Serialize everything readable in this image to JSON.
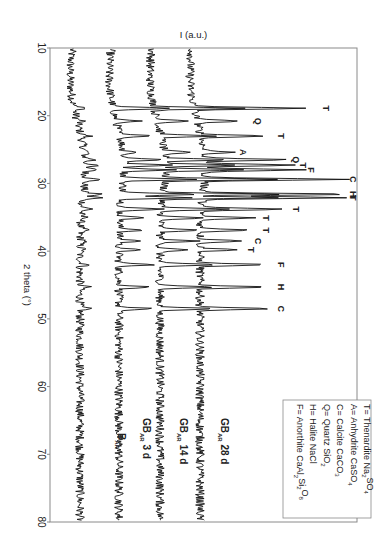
{
  "chart_data": {
    "type": "line",
    "title": "",
    "orientation": "rotated-90 (2theta axis vertical increasing downward, intensity increasing rightward)",
    "xlabel": "2 theta (°)",
    "ylabel": "I (a.u.)",
    "xlim": [
      10,
      80
    ],
    "x_ticks": [
      10,
      20,
      30,
      40,
      50,
      60,
      70,
      80
    ],
    "grid": false,
    "series": [
      {
        "name": "B_AR",
        "label_main": "B",
        "label_sub": "AR",
        "label_suffix": "",
        "offset": 0
      },
      {
        "name": "GB_AR 3 d",
        "label_main": "GB",
        "label_sub": "AR",
        "label_suffix": " 3 d",
        "offset": 1
      },
      {
        "name": "GB_AR 14 d",
        "label_main": "GB",
        "label_sub": "AR",
        "label_suffix": " 14 d",
        "offset": 2
      },
      {
        "name": "GB_AR 28 d",
        "label_main": "GB",
        "label_sub": "AR",
        "label_suffix": " 28 d",
        "offset": 3
      }
    ],
    "peaks": [
      {
        "two_theta": 18.9,
        "phase": "T",
        "strength": 0.75
      },
      {
        "two_theta": 20.8,
        "phase": "Q",
        "strength": 0.3
      },
      {
        "two_theta": 23.0,
        "phase": "T",
        "strength": 0.45
      },
      {
        "two_theta": 25.4,
        "phase": "A",
        "strength": 0.2
      },
      {
        "two_theta": 26.5,
        "phase": "Q",
        "strength": 0.55
      },
      {
        "two_theta": 27.3,
        "phase": "T",
        "strength": 0.6
      },
      {
        "two_theta": 28.0,
        "phase": "F",
        "strength": 0.65
      },
      {
        "two_theta": 29.4,
        "phase": "C",
        "strength": 0.95
      },
      {
        "two_theta": 31.6,
        "phase": "H",
        "strength": 1.0
      },
      {
        "two_theta": 32.1,
        "phase": "T",
        "strength": 0.95
      },
      {
        "two_theta": 33.8,
        "phase": "T",
        "strength": 0.55
      },
      {
        "two_theta": 35.1,
        "phase": "T",
        "strength": 0.35
      },
      {
        "two_theta": 36.9,
        "phase": "T",
        "strength": 0.35
      },
      {
        "two_theta": 38.5,
        "phase": "C",
        "strength": 0.3
      },
      {
        "two_theta": 39.8,
        "phase": "T",
        "strength": 0.25
      },
      {
        "two_theta": 42.0,
        "phase": "F",
        "strength": 0.45
      },
      {
        "two_theta": 45.3,
        "phase": "H",
        "strength": 0.45
      },
      {
        "two_theta": 48.5,
        "phase": "C",
        "strength": 0.45
      }
    ],
    "legend": {
      "position": "lower-right (rotated)",
      "entries": [
        {
          "text": "T= Thenardite Na",
          "formula_tail": [
            [
              "2",
              "sub"
            ],
            [
              "SO",
              ""
            ],
            [
              "4",
              "sub"
            ]
          ]
        },
        {
          "text": "A= Anhydrite CaSO",
          "formula_tail": [
            [
              "4",
              "sub"
            ]
          ]
        },
        {
          "text": "C= Calcite CaCO",
          "formula_tail": [
            [
              "3",
              "sub"
            ]
          ]
        },
        {
          "text": "Q= Quartz SiO",
          "formula_tail": [
            [
              "2",
              "sub"
            ]
          ]
        },
        {
          "text": "H= Halite NaCl",
          "formula_tail": []
        },
        {
          "text": "F= Anorthite CaAl",
          "formula_tail": [
            [
              "2",
              "sub"
            ],
            [
              "Si",
              ""
            ],
            [
              "2",
              "sub"
            ],
            [
              "O",
              ""
            ],
            [
              "8",
              "sub"
            ]
          ]
        }
      ]
    }
  }
}
